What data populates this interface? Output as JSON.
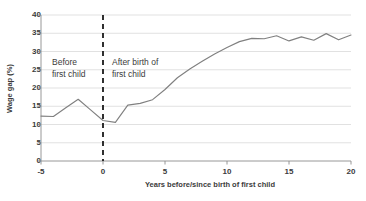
{
  "chart_data": {
    "type": "line",
    "title": "",
    "subtitle": "",
    "xlabel": "Years before/since birth of first child",
    "ylabel": "Wage gap (%)",
    "xlim": [
      -5,
      20
    ],
    "ylim": [
      0,
      40
    ],
    "xticks": [
      "-5",
      "0",
      "5",
      "10",
      "15",
      "20"
    ],
    "xtick_values": [
      -5,
      0,
      5,
      10,
      15,
      20
    ],
    "yticks": [
      "0",
      "5",
      "10",
      "15",
      "20",
      "25",
      "30",
      "35",
      "40"
    ],
    "ytick_values": [
      0,
      5,
      10,
      15,
      20,
      25,
      30,
      35,
      40
    ],
    "grid": "horizontal",
    "legend": "none",
    "line_color": "#808080",
    "reference_line": {
      "x": 0,
      "style": "dashed",
      "color": "#1a1a1a"
    },
    "annotations": [
      {
        "name": "before-first-child",
        "text": "Before\nfirst child",
        "line1": "Before",
        "line2": "first child",
        "x": -4.2,
        "y": 26
      },
      {
        "name": "after-birth-of-first-child",
        "text": "After birth of\nfirst child",
        "line1": "After birth of",
        "line2": "first child",
        "x": 0.5,
        "y": 26
      }
    ],
    "x": [
      -5,
      -4,
      -3,
      -2,
      -1,
      0,
      1,
      2,
      3,
      4,
      5,
      6,
      7,
      8,
      9,
      10,
      11,
      12,
      13,
      14,
      15,
      16,
      17,
      18,
      19,
      20
    ],
    "values": [
      12.3,
      12.2,
      14.6,
      16.9,
      14.0,
      11.1,
      10.6,
      15.3,
      15.8,
      16.8,
      19.6,
      22.8,
      25.2,
      27.3,
      29.3,
      31.1,
      32.7,
      33.6,
      33.5,
      34.3,
      32.9,
      34.0,
      33.1,
      34.9,
      33.2,
      34.5
    ],
    "series": [
      {
        "name": "Wage gap",
        "values": [
          12.3,
          12.2,
          14.6,
          16.9,
          14.0,
          11.1,
          10.6,
          15.3,
          15.8,
          16.8,
          19.6,
          22.8,
          25.2,
          27.3,
          29.3,
          31.1,
          32.7,
          33.6,
          33.5,
          34.3,
          32.9,
          34.0,
          33.1,
          34.9,
          33.2,
          34.5
        ]
      }
    ]
  }
}
